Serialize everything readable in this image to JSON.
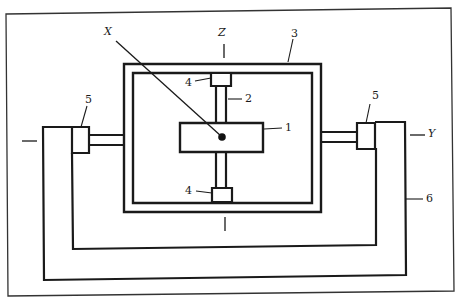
{
  "figure": {
    "type": "gyroscope gimbal schematic",
    "axes": {
      "x": "X",
      "y": "Y",
      "z": "Z"
    },
    "parts": {
      "p1": "1",
      "p2": "2",
      "p3": "3",
      "p4_top": "4",
      "p4_bottom": "4",
      "p5_left": "5",
      "p5_right": "5",
      "p6": "6"
    },
    "colors": {
      "line": "#1a1a1a",
      "border": "#333333",
      "background": "#ffffff"
    }
  }
}
